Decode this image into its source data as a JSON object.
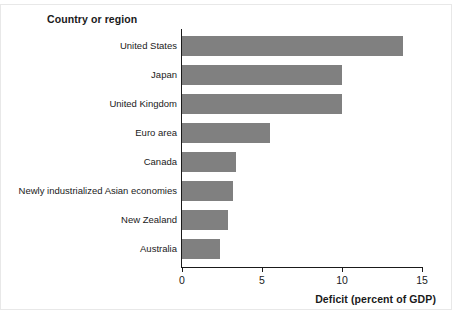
{
  "figure": {
    "header": "Country or region",
    "background_color": "#ffffff",
    "bar_color": "#808080",
    "axis_color": "#1a1a1a",
    "width": 452,
    "height": 316
  },
  "chart_data": {
    "type": "bar",
    "orientation": "horizontal",
    "title": "Country or region",
    "xlabel": "Deficit (percent of GDP)",
    "ylabel": "Country or region",
    "xlim": [
      0,
      15
    ],
    "xticks": [
      0,
      5,
      10,
      15
    ],
    "xtick_labels": [
      "0",
      "5",
      "10",
      "15"
    ],
    "grid": false,
    "legend": false,
    "categories": [
      "United States",
      "Japan",
      "United Kingdom",
      "Euro area",
      "Canada",
      "Newly industrialized Asian economies",
      "New Zealand",
      "Australia"
    ],
    "values": [
      13.8,
      10.0,
      10.0,
      5.5,
      3.4,
      3.2,
      2.9,
      2.4
    ],
    "series": [
      {
        "name": "Deficit (percent of GDP)",
        "color": "#808080",
        "values": [
          13.8,
          10.0,
          10.0,
          5.5,
          3.4,
          3.2,
          2.9,
          2.4
        ]
      }
    ]
  }
}
